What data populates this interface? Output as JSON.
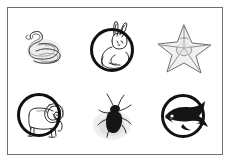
{
  "page": {
    "background_color": "#ffffff",
    "border_color": "#6e6e6e",
    "circle_color": "#111111",
    "sketch_color": "#5e5e5e",
    "rows": 2,
    "columns": 3
  },
  "items": [
    {
      "id": 1,
      "animal": "snake",
      "icon": "snake-icon",
      "row": 1,
      "column": 1,
      "circled": false,
      "style": "pencil sketch of a coiled snake"
    },
    {
      "id": 2,
      "animal": "rabbit",
      "icon": "rabbit-icon",
      "row": 1,
      "column": 2,
      "circled": true,
      "style": "line drawing of a sitting rabbit with a heavy circle drawn around it"
    },
    {
      "id": 3,
      "animal": "starfish",
      "icon": "starfish-icon",
      "row": 1,
      "column": 3,
      "circled": false,
      "style": "pencil sketch of a five-armed starfish"
    },
    {
      "id": 4,
      "animal": "lion",
      "icon": "lion-icon",
      "row": 2,
      "column": 1,
      "circled": true,
      "style": "line drawing of a standing lion with a heavy circle drawn around it"
    },
    {
      "id": 5,
      "animal": "beetle",
      "icon": "beetle-icon",
      "row": 2,
      "column": 2,
      "circled": false,
      "style": "dark beetle or cockroach with long antennae on a pale shadow"
    },
    {
      "id": 6,
      "animal": "whale",
      "icon": "whale-icon",
      "row": 2,
      "column": 3,
      "circled": true,
      "style": "dark whale with white belly and a heavy circle drawn around it"
    }
  ]
}
